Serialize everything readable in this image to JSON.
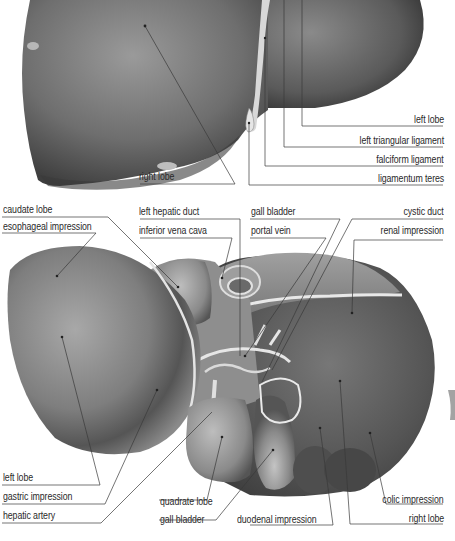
{
  "figure": {
    "views": [
      "anterior view (top)",
      "inferior/visceral view (bottom)"
    ],
    "colors": {
      "background": "#ffffff",
      "organ_dark": "#4a4a4a",
      "organ_mid": "#7d7d7d",
      "organ_light": "#b9b9b9",
      "leader_line": "#3a3a3a",
      "label_text": "#2a2a2a"
    }
  },
  "labels": {
    "top_view": {
      "right_lobe": "right lobe",
      "left_lobe": "left lobe",
      "left_triangular_ligament": "left triangular ligament",
      "falciform_ligament": "falciform ligament",
      "ligamentum_teres": "ligamentum teres"
    },
    "bottom_view": {
      "caudate_lobe": "caudate lobe",
      "esophageal_impression": "esophageal impression",
      "left_hepatic_duct": "left hepatic duct",
      "inferior_vena_cava": "inferior vena cava",
      "gall_bladder_top": "gall bladder",
      "portal_vein": "portal vein",
      "cystic_duct": "cystic duct",
      "renal_impression": "renal impression",
      "left_lobe": "left lobe",
      "gastric_impression": "gastric impression",
      "hepatic_artery": "hepatic artery",
      "quadrate_lobe": "quadrate lobe",
      "gall_bladder_bottom": "gall bladder",
      "duodenal_impression": "duodenal impression",
      "colic_impression": "colic impression",
      "right_lobe": "right lobe"
    }
  }
}
